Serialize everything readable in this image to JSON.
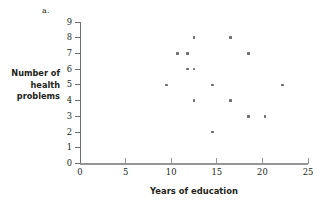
{
  "figure": {
    "panel_label": "a."
  },
  "chart_data": {
    "type": "scatter",
    "title": "",
    "xlabel": "Years of education",
    "ylabel": "Number of health problems",
    "ylabel_lines": [
      "Number of",
      "health",
      "problems"
    ],
    "xlim": [
      0,
      25
    ],
    "ylim": [
      0,
      9
    ],
    "xticks": [
      0,
      5,
      10,
      15,
      20,
      25
    ],
    "yticks": [
      0,
      1,
      2,
      3,
      4,
      5,
      6,
      7,
      8,
      9
    ],
    "xticklabels": [
      "0",
      "5",
      "10",
      "15",
      "20",
      "25"
    ],
    "yticklabels": [
      "0",
      "1",
      "2",
      "3",
      "4",
      "5",
      "6",
      "7",
      "8",
      "9"
    ],
    "grid": false,
    "legend": null,
    "marker_color": "#6d6e71",
    "axis_color": "#939598",
    "points": [
      {
        "x": 9.5,
        "y": 5
      },
      {
        "x": 10.7,
        "y": 7
      },
      {
        "x": 11.8,
        "y": 7
      },
      {
        "x": 11.8,
        "y": 6
      },
      {
        "x": 12.5,
        "y": 8
      },
      {
        "x": 12.5,
        "y": 6
      },
      {
        "x": 12.5,
        "y": 4
      },
      {
        "x": 14.5,
        "y": 5
      },
      {
        "x": 14.5,
        "y": 2
      },
      {
        "x": 16.5,
        "y": 8
      },
      {
        "x": 16.5,
        "y": 4
      },
      {
        "x": 18.5,
        "y": 7
      },
      {
        "x": 18.5,
        "y": 3
      },
      {
        "x": 20.3,
        "y": 3
      },
      {
        "x": 22.2,
        "y": 5
      }
    ]
  }
}
